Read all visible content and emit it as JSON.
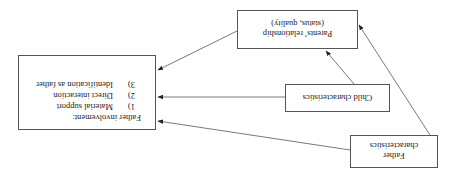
{
  "diagram": {
    "orientation": "rotated 180 degrees (upside down)",
    "nodes": {
      "father_characteristics": {
        "lines": [
          "Father",
          "characteristics"
        ]
      },
      "child_characteristics": {
        "lines": [
          "Child characteristics"
        ]
      },
      "parents_relationship": {
        "lines": [
          "Parents’ relationship",
          "(status, quality)"
        ]
      },
      "father_involvement": {
        "title": "Father involvement:",
        "items": [
          {
            "num": "1)",
            "label": "Material support"
          },
          {
            "num": "2)",
            "label": "Direct interaction"
          },
          {
            "num": "3)",
            "label": "Identification as father"
          }
        ]
      }
    },
    "edges": [
      {
        "from": "Father characteristics",
        "to": "Father involvement"
      },
      {
        "from": "Father characteristics",
        "to": "Parents’ relationship"
      },
      {
        "from": "Child characteristics",
        "to": "Father involvement"
      },
      {
        "from": "Child characteristics",
        "to": "Parents’ relationship"
      },
      {
        "from": "Parents’ relationship",
        "to": "Father involvement"
      }
    ],
    "colors": {
      "line": "#555555",
      "text": "#222222",
      "background": "#ffffff"
    }
  }
}
